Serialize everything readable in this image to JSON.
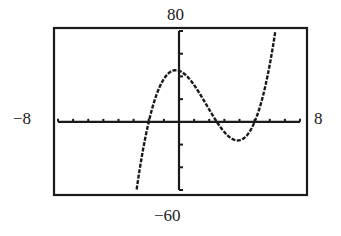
{
  "chart_data": {
    "type": "line",
    "title": "",
    "xlabel": "",
    "ylabel": "",
    "xlim": [
      -8,
      8
    ],
    "ylim": [
      -60,
      80
    ],
    "xscale": 1,
    "yscale": 20,
    "grid": false,
    "legend": null,
    "window_labels": {
      "xmin": "−8",
      "xmax": "8",
      "ymin": "−60",
      "ymax": "80"
    },
    "series": [
      {
        "name": "f(x)",
        "style": "dotted-pixel",
        "approx_function": "1.8*(x+2)*(x-2.5)*(x-5)",
        "x_intercepts": [
          -2,
          2.5,
          5
        ],
        "local_max": {
          "x": -0.2,
          "y": 46
        },
        "local_min": {
          "x": 4,
          "y": -18
        },
        "x": [
          -2.8,
          -2.5,
          -2,
          -1.5,
          -1,
          -0.5,
          0,
          0.5,
          1,
          1.5,
          2,
          2.5,
          3,
          3.5,
          4,
          4.5,
          5,
          5.5,
          6,
          6.4
        ],
        "y": [
          -60,
          -33.8,
          0,
          22.1,
          37.8,
          46.7,
          45,
          40.5,
          32.4,
          21.6,
          10.8,
          0,
          -9,
          -15.3,
          -16.2,
          -11.8,
          0,
          21.8,
          54,
          80
        ]
      }
    ]
  },
  "colors": {
    "ink": "#1a1a1a",
    "background": "#ffffff"
  }
}
